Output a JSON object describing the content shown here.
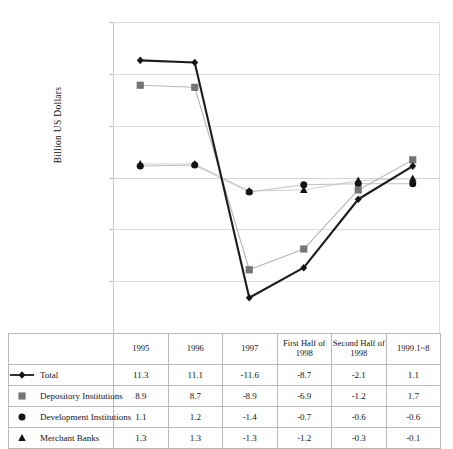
{
  "axis": {
    "y_title": "Billion US Dollars",
    "y_ticks": [
      "15.0",
      "10.0",
      "5.0",
      "0.0",
      "-5.0",
      "-10.0",
      "-15.0"
    ]
  },
  "table": {
    "columns": [
      "1995",
      "1996",
      "1997",
      "First Half of 1998",
      "Second Half of 1998",
      "1999.1~8"
    ],
    "rows": [
      {
        "label": "Total",
        "marker": "diamond-line-marker",
        "values": [
          "11.3",
          "11.1",
          "-11.6",
          "-8.7",
          "-2.1",
          "1.1"
        ]
      },
      {
        "label": "Depository Institutions",
        "marker": "square-marker",
        "values": [
          "8.9",
          "8.7",
          "-8.9",
          "-6.9",
          "-1.2",
          "1.7"
        ]
      },
      {
        "label": "Development Institutions",
        "marker": "circle-marker",
        "values": [
          "1.1",
          "1.2",
          "-1.4",
          "-0.7",
          "-0.6",
          "-0.6"
        ]
      },
      {
        "label": "Merchant Banks",
        "marker": "triangle-marker",
        "values": [
          "1.3",
          "1.3",
          "-1.3",
          "-1.2",
          "-0.3",
          "-0.1"
        ]
      }
    ]
  },
  "chart_data": {
    "type": "line",
    "title": "",
    "xlabel": "",
    "ylabel": "Billion US Dollars",
    "categories": [
      "1995",
      "1996",
      "1997",
      "First Half of 1998",
      "Second Half of 1998",
      "1999.1~8"
    ],
    "ylim": [
      -15.0,
      15.0
    ],
    "ytick_values": [
      15.0,
      10.0,
      5.0,
      0.0,
      -5.0,
      -10.0,
      -15.0
    ],
    "grid": true,
    "legend_position": "table-left-column",
    "series": [
      {
        "name": "Total",
        "marker": "diamond",
        "color": "#1c1c1c",
        "values": [
          11.3,
          11.1,
          -11.6,
          -8.7,
          -2.1,
          1.1
        ]
      },
      {
        "name": "Depository Institutions",
        "marker": "square",
        "color": "#7a7a7a",
        "values": [
          8.9,
          8.7,
          -8.9,
          -6.9,
          -1.2,
          1.7
        ]
      },
      {
        "name": "Development Institutions",
        "marker": "circle",
        "color": "#1c1c1c",
        "values": [
          1.1,
          1.2,
          -1.4,
          -0.7,
          -0.6,
          -0.6
        ]
      },
      {
        "name": "Merchant Banks",
        "marker": "triangle",
        "color": "#1c1c1c",
        "values": [
          1.3,
          1.3,
          -1.3,
          -1.2,
          -0.3,
          -0.1
        ]
      }
    ]
  },
  "colors": {
    "total_line": "#1c1c1c",
    "depository_line": "#b0b0b0",
    "development_line": "#bdbdbd",
    "merchant_line": "#cccccc",
    "grid": "#dddddd",
    "table_border": "#b9b9b9"
  }
}
